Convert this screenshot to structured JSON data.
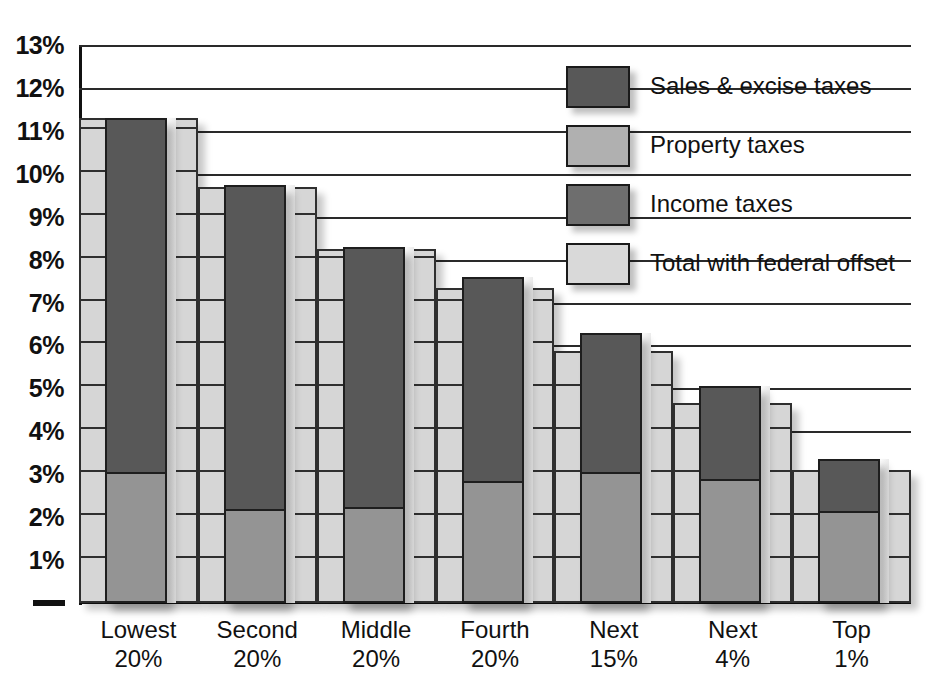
{
  "chart_data": {
    "type": "bar",
    "title": "",
    "subtitle": "",
    "xlabel": "",
    "ylabel": "",
    "stacked": true,
    "grid": true,
    "legend_position": "top-right",
    "ylim": [
      0,
      13
    ],
    "ytick_labels": [
      "1%",
      "2%",
      "3%",
      "4%",
      "5%",
      "6%",
      "7%",
      "8%",
      "9%",
      "10%",
      "11%",
      "12%",
      "13%"
    ],
    "ytick_values": [
      1,
      2,
      3,
      4,
      5,
      6,
      7,
      8,
      9,
      10,
      11,
      12,
      13
    ],
    "categories": [
      {
        "line1": "Lowest",
        "line2": "20%"
      },
      {
        "line1": "Second",
        "line2": "20%"
      },
      {
        "line1": "Middle",
        "line2": "20%"
      },
      {
        "line1": "Fourth",
        "line2": "20%"
      },
      {
        "line1": "Next",
        "line2": "15%"
      },
      {
        "line1": "Next",
        "line2": "4%"
      },
      {
        "line1": "Top",
        "line2": "1%"
      }
    ],
    "series": [
      {
        "name": "Sales & excise taxes",
        "color": "#585858",
        "values": [
          8.3,
          7.6,
          6.1,
          4.8,
          3.3,
          2.2,
          1.25
        ]
      },
      {
        "name": "Income taxes",
        "color": "#949494",
        "values": [
          3.0,
          2.15,
          2.2,
          2.8,
          3.0,
          2.85,
          2.1
        ]
      },
      {
        "name": "Total with federal offset",
        "color": "#d6d6d6",
        "values": [
          11.3,
          9.7,
          8.25,
          7.35,
          5.88,
          4.65,
          3.1
        ]
      }
    ],
    "totals": [
      11.3,
      9.75,
      8.3,
      7.6,
      6.3,
      5.05,
      3.35
    ],
    "legend": [
      {
        "label": "Sales & excise taxes",
        "color": "#585858"
      },
      {
        "label": "Property taxes",
        "color": "#b0b0b0"
      },
      {
        "label": "Income taxes",
        "color": "#6e6e6e"
      },
      {
        "label": "Total with federal offset",
        "color": "#d9d9d9"
      }
    ]
  }
}
